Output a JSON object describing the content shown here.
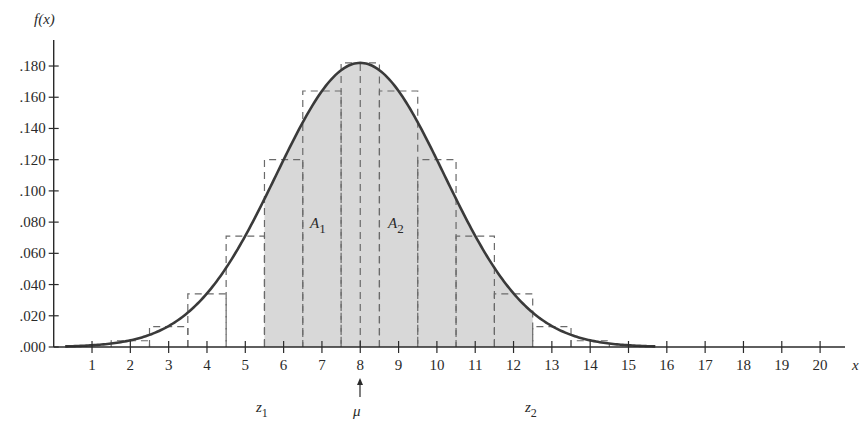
{
  "chart_data": {
    "type": "bar",
    "subtype": "histogram with normal curve overlay",
    "title": "",
    "xlabel": "x",
    "ylabel": "f(x)",
    "xlim": [
      0,
      21
    ],
    "ylim": [
      0,
      0.19
    ],
    "x_ticks": [
      1,
      2,
      3,
      4,
      5,
      6,
      7,
      8,
      9,
      10,
      11,
      12,
      13,
      14,
      15,
      16,
      17,
      18,
      19,
      20
    ],
    "x_tick_labels": [
      "1",
      "2",
      "3",
      "4",
      "5",
      "6",
      "7",
      "8",
      "9",
      "10",
      "11",
      "12",
      "13",
      "14",
      "15",
      "16",
      "17",
      "18",
      "19",
      "20"
    ],
    "y_ticks": [
      0.0,
      0.02,
      0.04,
      0.06,
      0.08,
      0.1,
      0.12,
      0.14,
      0.16,
      0.18
    ],
    "y_tick_labels": [
      ".000",
      ".020",
      ".040",
      ".060",
      ".080",
      ".100",
      ".120",
      ".140",
      ".160",
      ".180"
    ],
    "grid": false,
    "categories": [
      2,
      3,
      4,
      5,
      6,
      7,
      8,
      9,
      10,
      11,
      12,
      13,
      14
    ],
    "values": [
      0.004,
      0.013,
      0.034,
      0.071,
      0.12,
      0.164,
      0.182,
      0.164,
      0.12,
      0.071,
      0.034,
      0.013,
      0.004
    ],
    "bar_style": "dashed outline, width 1 (x-0.5 to x+0.5)",
    "curve": {
      "type": "normal",
      "mean": 8,
      "sd": 2.19,
      "peak": 0.182,
      "x_range": [
        0.3,
        15.7
      ]
    },
    "shaded_region": {
      "from": 5.5,
      "to": 12.5,
      "color": "#d6d6d6"
    },
    "annotations": [
      {
        "text": "A1",
        "x": 7.0,
        "y": 0.085,
        "note": "area left of mean"
      },
      {
        "text": "A2",
        "x": 9.0,
        "y": 0.085,
        "note": "area right of mean"
      },
      {
        "text": "μ",
        "x": 8,
        "position": "below axis with up arrow"
      },
      {
        "text": "z1",
        "x": 6.0,
        "position": "below axis"
      },
      {
        "text": "z2",
        "x": 12.0,
        "position": "below axis"
      }
    ],
    "legend": null
  },
  "labels": {
    "y_axis_title": "f(x)",
    "x_axis_title": "x",
    "a1_main": "A",
    "a1_sub": "1",
    "a2_main": "A",
    "a2_sub": "2",
    "z1_main": "z",
    "z1_sub": "1",
    "z2_main": "z",
    "z2_sub": "2",
    "mu": "μ"
  },
  "colors": {
    "axis": "#2a2a2a",
    "curve": "#3a3a3a",
    "dash": "#6a6a6a",
    "shade": "#d8d8d8",
    "text": "#2a2a2a"
  }
}
